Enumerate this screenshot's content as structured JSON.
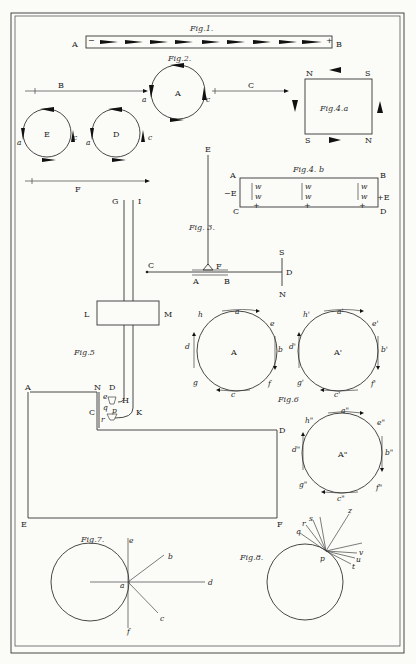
{
  "plate": {
    "figures": {
      "fig1": {
        "title": "Fig.1.",
        "left": "A",
        "right": "B",
        "minus": "−",
        "plus": "+"
      },
      "fig2": {
        "title": "Fig.2.",
        "circle_A": "A",
        "a": "a",
        "c": "c",
        "B": "B",
        "C": "C",
        "circle_E": "E",
        "circle_D": "D",
        "E_a": "a",
        "E_c": "c",
        "D_a": "a",
        "D_c": "c",
        "F": "F"
      },
      "fig3": {
        "title": "Fig. 3.",
        "E": "E",
        "C": "C",
        "A": "A",
        "B": "B",
        "F": "F",
        "S": "S",
        "D": "D",
        "N": "N"
      },
      "fig4a": {
        "title": "Fig.4.a",
        "NW": "N",
        "NE": "S",
        "SW": "S",
        "SE": "N"
      },
      "fig4b": {
        "title": "Fig.4. b",
        "A": "A",
        "B": "B",
        "C": "C",
        "D": "D",
        "left_E": "−E",
        "right_E": "+E",
        "w": "w",
        "plus": "+"
      },
      "fig5": {
        "title": "Fig.5",
        "G": "G",
        "I": "I",
        "L": "L",
        "M": "M",
        "A": "A",
        "N": "N",
        "D_small": "D",
        "H": "H",
        "C": "C",
        "K": "K",
        "D": "D",
        "E": "E",
        "F": "F",
        "p": "p",
        "q": "q",
        "r": "r",
        "e": "e"
      },
      "fig6": {
        "title": "Fig.6",
        "circle1": {
          "center": "A",
          "labels": [
            "a",
            "b",
            "c",
            "d",
            "e",
            "f",
            "g",
            "h",
            "s",
            "t"
          ]
        },
        "circle2": {
          "center": "A'",
          "labels": [
            "a'",
            "b'",
            "c'",
            "d'",
            "e'",
            "f'",
            "g'",
            "h'"
          ]
        },
        "circle3": {
          "center": "A\"",
          "labels": [
            "a\"",
            "b\"",
            "c\"",
            "d\"",
            "e\"",
            "f\"",
            "g\"",
            "h\""
          ]
        }
      },
      "fig7": {
        "title": "Fig.7.",
        "a": "a",
        "b": "b",
        "c": "c",
        "d": "d",
        "e": "e",
        "f": "f"
      },
      "fig8": {
        "title": "Fig.8.",
        "p": "p",
        "q": "q",
        "r": "r",
        "s": "s",
        "z": "z",
        "v": "v",
        "u": "u",
        "t": "t"
      }
    }
  }
}
